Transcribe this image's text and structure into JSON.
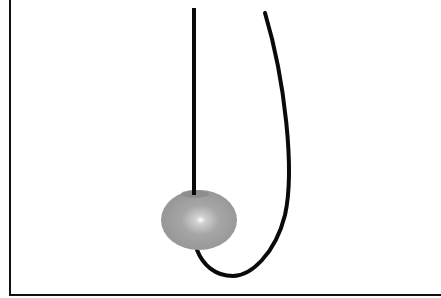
{
  "diagram": {
    "colors": {
      "background": "#ffffff",
      "frame": "#111111",
      "string": "#0a0a0a",
      "bead_outer": "#8c8c8c",
      "bead_mid": "#b0b0b0",
      "bead_highlight": "#ffffff",
      "bead_hole": "#7a7a7a"
    },
    "frame": {
      "left_x": 10,
      "bottom_y": 295,
      "stroke_width": 2
    },
    "vertical_string": {
      "x": 194,
      "y_top": 8,
      "y_bottom": 195,
      "stroke_width": 4
    },
    "curved_string": {
      "path": "M 265 13 C 285 80, 295 170, 285 215 C 275 255, 250 276, 233 276 C 215 276, 203 265, 197 250",
      "stroke_width": 4
    },
    "bead": {
      "cx": 199,
      "cy": 220,
      "rx": 38,
      "ry": 30,
      "highlight_cx": 200,
      "highlight_cy": 221,
      "hole_cx": 195,
      "hole_cy": 194,
      "hole_rx": 14,
      "hole_ry": 4
    }
  }
}
